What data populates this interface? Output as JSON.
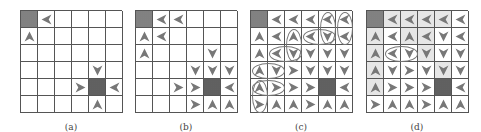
{
  "colors": {
    "grid_line": "#555555",
    "arrow": "#777777",
    "arrow_dark": "#555555",
    "goal": "#8a8a8a",
    "obstacle": "#6a6a6a",
    "shade": "#e6e6e6"
  },
  "legend": {
    "U": "up-arrow",
    "D": "down-arrow",
    "L": "left-arrow",
    "R": "right-arrow",
    "G": "goal-cell",
    "X": "obstacle-cell"
  },
  "panels": [
    {
      "label": "(a)",
      "grid": [
        [
          "G",
          "L",
          "",
          "",
          "",
          ""
        ],
        [
          "U",
          "",
          "",
          "",
          "",
          ""
        ],
        [
          "",
          "",
          "",
          "",
          "",
          ""
        ],
        [
          "",
          "",
          "",
          "",
          "D",
          ""
        ],
        [
          "",
          "",
          "",
          "R",
          "X",
          "L"
        ],
        [
          "",
          "",
          "",
          "",
          "U",
          ""
        ]
      ]
    },
    {
      "label": "(b)",
      "grid": [
        [
          "G",
          "L",
          "L",
          "",
          "",
          ""
        ],
        [
          "U",
          "L",
          "",
          "",
          "",
          ""
        ],
        [
          "U",
          "",
          "",
          "",
          "D",
          ""
        ],
        [
          "",
          "",
          "",
          "D",
          "D",
          "D"
        ],
        [
          "",
          "",
          "R",
          "R",
          "X",
          "L"
        ],
        [
          "",
          "",
          "",
          "R",
          "U",
          "U"
        ]
      ]
    },
    {
      "label": "(c)",
      "grid": [
        [
          "G",
          "L",
          "L",
          "L",
          "L",
          "L"
        ],
        [
          "U",
          "L",
          "U",
          "L",
          "D",
          "L"
        ],
        [
          "U",
          "L",
          "D",
          "D",
          "D",
          "D"
        ],
        [
          "U",
          "D",
          "R",
          "D",
          "D",
          "D"
        ],
        [
          "U",
          "R",
          "R",
          "R",
          "X",
          "L"
        ],
        [
          "R",
          "U",
          "U",
          "R",
          "U",
          "U"
        ]
      ],
      "ovals": [
        {
          "col": 4,
          "row": 0,
          "w": 1,
          "h": 2
        },
        {
          "col": 5,
          "row": 0,
          "w": 1,
          "h": 2
        },
        {
          "col": 2,
          "row": 1,
          "w": 1,
          "h": 2
        },
        {
          "col": 3,
          "row": 1,
          "w": 2,
          "h": 1
        },
        {
          "col": 1,
          "row": 2,
          "w": 2,
          "h": 1
        },
        {
          "col": 0,
          "row": 3,
          "w": 2,
          "h": 1
        },
        {
          "col": 0,
          "row": 4,
          "w": 2,
          "h": 1
        },
        {
          "col": 0,
          "row": 4,
          "w": 1,
          "h": 2
        }
      ]
    },
    {
      "label": "(d)",
      "grid": [
        [
          "G",
          "L",
          "L",
          "L",
          "L",
          "L"
        ],
        [
          "U",
          "L",
          "U",
          "L",
          "D",
          "L"
        ],
        [
          "U",
          "L",
          "D",
          "D",
          "D",
          "D"
        ],
        [
          "U",
          "D",
          "R",
          "D",
          "D",
          "D"
        ],
        [
          "U",
          "R",
          "R",
          "R",
          "X",
          "L"
        ],
        [
          "R",
          "U",
          "U",
          "R",
          "U",
          "U"
        ]
      ],
      "shaded": [
        [
          1,
          0
        ],
        [
          2,
          0
        ],
        [
          3,
          0
        ],
        [
          4,
          0
        ],
        [
          2,
          1
        ],
        [
          3,
          1
        ],
        [
          3,
          2
        ],
        [
          4,
          3
        ]
      ],
      "ovals": [
        {
          "col": 1,
          "row": 2,
          "w": 2,
          "h": 1
        }
      ]
    }
  ]
}
